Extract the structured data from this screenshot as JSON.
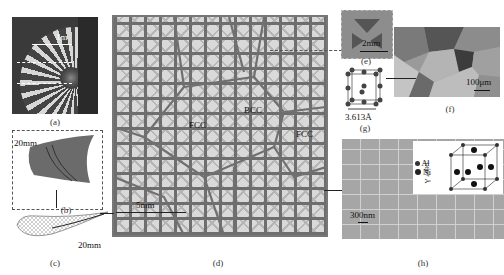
{
  "figure": {
    "panels": [
      {
        "id": "a",
        "caption": "(a)",
        "description": "Turbofan engine photograph",
        "scale_bar": "1m"
      },
      {
        "id": "b",
        "caption": "(b)",
        "description": "Turbine blade section",
        "scale_bar": "20mm"
      },
      {
        "id": "c",
        "caption": "(c)",
        "description": "Blade cross-section lattice",
        "scale_bar": "20mm"
      },
      {
        "id": "d",
        "caption": "(d)",
        "description": "Polycrystal-like lattice structure",
        "scale_bar": "5mm",
        "grain_labels": [
          "FCC",
          "BCC",
          "FCC"
        ]
      },
      {
        "id": "e",
        "caption": "(e)",
        "description": "Unit cell close-up",
        "scale_bar": "2mm"
      },
      {
        "id": "f",
        "caption": "(f)",
        "description": "Metallic grain microstructure",
        "scale_bar": "100μm"
      },
      {
        "id": "g",
        "caption": "(g)",
        "description": "FCC crystal unit cell",
        "dimension": "3.613Å"
      },
      {
        "id": "h",
        "caption": "(h)",
        "description": "Precipitate microstructure",
        "scale_bar": "300nm",
        "inset": {
          "dimension": "3.667 Å",
          "legend": [
            "Al",
            "Ni"
          ]
        }
      }
    ]
  },
  "colors": {
    "lattice_gray": "#8a8a8a",
    "background": "#ffffff",
    "atom": "#333333"
  }
}
